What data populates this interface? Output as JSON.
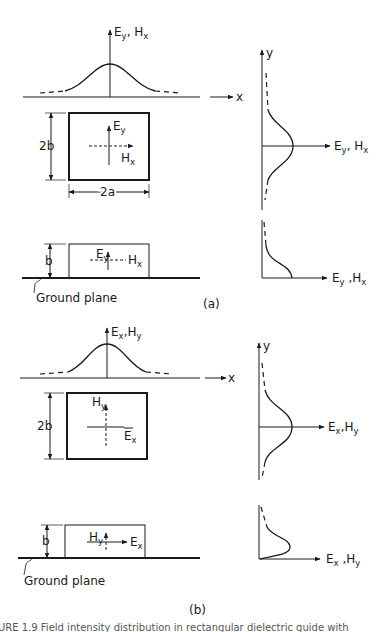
{
  "figure": {
    "ink_color": "#1a1a1a",
    "background": "#ffffff",
    "part_a": {
      "label": "(a)",
      "top_profile": {
        "axis_label_main1": "E",
        "axis_label_sub1": "y",
        "axis_label_main2": ", H",
        "axis_label_sub2": "x",
        "x_axis_label": "x"
      },
      "cross_section": {
        "height_label": "2b",
        "width_label": "2a",
        "vertical_field_main": "E",
        "vertical_field_sub": "y",
        "horizontal_field_main": "H",
        "horizontal_field_sub": "x"
      },
      "ground_section": {
        "height_label": "b",
        "vertical_field_main": "E",
        "vertical_field_sub": "y",
        "horizontal_field_main": "H",
        "horizontal_field_sub": "x",
        "ground_label": "Ground plane"
      },
      "side_profile": {
        "y_axis_label": "y",
        "field_main1": "E",
        "field_sub1": "y",
        "field_main2": ", H",
        "field_sub2": "x"
      },
      "ground_side_profile": {
        "field_main1": "E",
        "field_sub1": "y",
        "field_main2": " ,H",
        "field_sub2": "x"
      }
    },
    "part_b": {
      "label": "(b)",
      "top_profile": {
        "axis_label_main1": "E",
        "axis_label_sub1": "x",
        "axis_label_main2": ",H",
        "axis_label_sub2": "y",
        "x_axis_label": "x"
      },
      "cross_section": {
        "height_label": "2b",
        "vertical_field_main": "H",
        "vertical_field_sub": "y",
        "horizontal_field_main": "E",
        "horizontal_field_sub": "x"
      },
      "ground_section": {
        "height_label": "b",
        "vertical_field_main": "H",
        "vertical_field_sub": "y",
        "horizontal_field_main": "E",
        "horizontal_field_sub": "x",
        "ground_label": "Ground plane"
      },
      "side_profile": {
        "y_axis_label": "y",
        "field_main1": "E",
        "field_sub1": "x",
        "field_main2": ",H",
        "field_sub2": "y"
      },
      "ground_side_profile": {
        "field_main1": "E",
        "field_sub1": "x",
        "field_main2": " ,H",
        "field_sub2": "y"
      }
    },
    "caption_partial": "URE 1.9   Field intensity distribution in rectangular dielectric guide with"
  }
}
